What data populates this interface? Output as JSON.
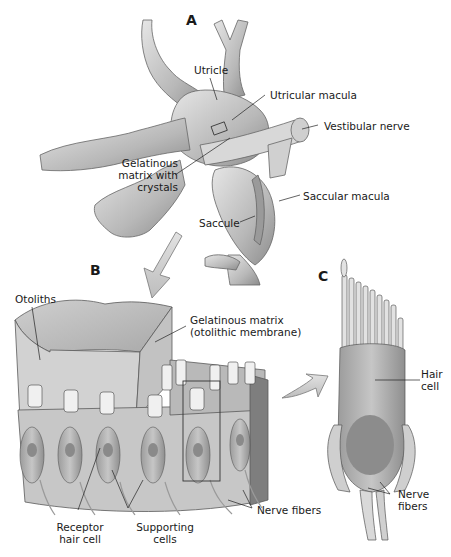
{
  "figure": {
    "panels": {
      "a": "A",
      "b": "B",
      "c": "C"
    },
    "panel_a_labels": {
      "utricle": "Utricle",
      "utricular_macula": "Utricular macula",
      "vestibular_nerve": "Vestibular nerve",
      "gelatinous_matrix_line1": "Gelatinous",
      "gelatinous_matrix_line2": "matrix with",
      "gelatinous_matrix_line3": "crystals",
      "saccule": "Saccule",
      "saccular_macula": "Saccular macula"
    },
    "panel_b_labels": {
      "otoliths": "Otoliths",
      "gelatinous_matrix_line1": "Gelatinous matrix",
      "gelatinous_matrix_line2": "(otolithic membrane)",
      "receptor_line1": "Receptor",
      "receptor_line2": "hair cell",
      "supporting_line1": "Supporting",
      "supporting_line2": "cells",
      "nerve_fibers": "Nerve fibers"
    },
    "panel_c_labels": {
      "hair_line1": "Hair",
      "hair_line2": "cell",
      "nerve_line1": "Nerve",
      "nerve_line2": "fibers"
    },
    "colors": {
      "tissue_light": "#d9d9d9",
      "tissue_mid": "#b5b5b5",
      "tissue_dark": "#8a8a8a",
      "outline": "#555555",
      "arrow_fill": "#cfcfcf"
    }
  }
}
